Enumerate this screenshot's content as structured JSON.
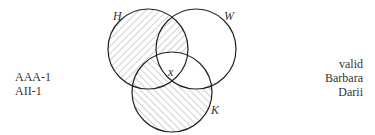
{
  "diagram": {
    "circles": [
      {
        "label": "H",
        "shading": "hatched-back"
      },
      {
        "label": "W",
        "shading": "none"
      },
      {
        "label": "K",
        "shading": "hatched-forward"
      }
    ],
    "marker": "x",
    "labels": {
      "H": "H",
      "W": "W",
      "K": "K",
      "x": "x"
    }
  },
  "left_text": [
    "AAA-1",
    "AII-1"
  ],
  "right_text": [
    "valid",
    "Barbara",
    "Darii"
  ]
}
